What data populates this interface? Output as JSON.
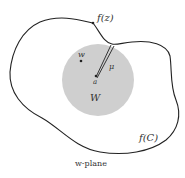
{
  "diagram": {
    "caption": "w-plane",
    "labels": {
      "fz": "f(z)",
      "fC": "f(C)",
      "w": "w",
      "a": "a",
      "mu": "μ",
      "W": "W"
    },
    "colors": {
      "curve": "#222222",
      "disk": "#cfcfcf",
      "text": "#333333"
    }
  }
}
